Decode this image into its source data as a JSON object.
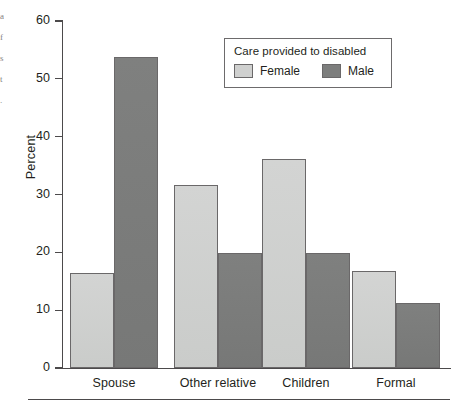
{
  "chart_data": {
    "type": "bar",
    "title": "",
    "xlabel": "",
    "ylabel": "Percent",
    "ylim": [
      0,
      60
    ],
    "yticks": [
      0,
      10,
      20,
      30,
      40,
      50,
      60
    ],
    "ytick_labels": [
      "0",
      "10",
      "20",
      "30",
      "40",
      "50",
      "60"
    ],
    "grid": false,
    "legend_position": "upper right",
    "legend_title": "Care provided to disabled",
    "categories": [
      "Spouse",
      "Other relative",
      "Children",
      "Formal"
    ],
    "series": [
      {
        "name": "Female",
        "color": "#cfd0cf",
        "values": [
          16.4,
          31.6,
          36.2,
          16.8
        ]
      },
      {
        "name": "Male",
        "color": "#7d7e7d",
        "values": [
          53.7,
          19.9,
          19.9,
          11.2
        ]
      }
    ]
  },
  "axes": {
    "y_title": "Percent",
    "tick_labels": [
      "60",
      "50",
      "40",
      "30",
      "20",
      "10",
      "0"
    ]
  },
  "legend": {
    "title": "Care provided to disabled",
    "entries": [
      {
        "label": "Female",
        "swatch": "female"
      },
      {
        "label": "Male",
        "swatch": "male"
      }
    ]
  },
  "margin_glyphs": [
    "a",
    "f",
    "s",
    "t",
    "."
  ],
  "colors": {
    "female": "#cfd0cf",
    "male": "#7d7e7d",
    "ink": "#231f20",
    "rule": "#4c4a4b",
    "bar_outline": "#6a6869",
    "background": "#ffffff"
  }
}
